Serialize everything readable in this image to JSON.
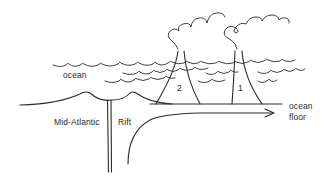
{
  "diagram": {
    "type": "cross-section illustration",
    "labels": {
      "ocean": "ocean",
      "mid_atlantic": "Mid-Atlantic",
      "rift": "Rift",
      "ocean_floor_line1": "ocean",
      "ocean_floor_line2": "floor",
      "volcano_2": "2",
      "volcano_1": "1"
    },
    "elements": [
      {
        "id": "ocean-surface-waves",
        "description": "three rows of wavy lines representing the ocean"
      },
      {
        "id": "mid-ocean-ridge",
        "description": "curved ridge profile with two bumps above the rift"
      },
      {
        "id": "rift-channel",
        "description": "vertical double line descending from ridge"
      },
      {
        "id": "ocean-floor-line",
        "description": "horizontal seafloor line extending right"
      },
      {
        "id": "volcano-2",
        "description": "older volcano nearer the rift, with smoke plume"
      },
      {
        "id": "volcano-1",
        "description": "younger volcano farther from rift, with smoke plume"
      },
      {
        "id": "spreading-arrow",
        "description": "curved arrow rising from rift and pointing right along ocean floor"
      }
    ],
    "colors": {
      "ink": "#2b2b2b",
      "background": "#ffffff"
    }
  }
}
